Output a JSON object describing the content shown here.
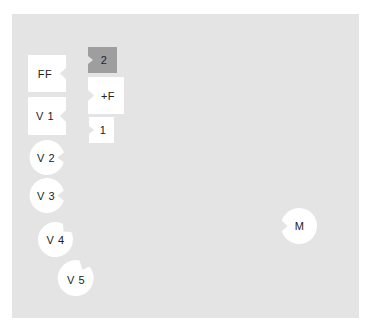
{
  "colors": {
    "background": "#ffffff",
    "panel": "#e4e4e4",
    "piece_fill": "#ffffff",
    "piece_selected_fill": "#9e9e9e",
    "text": "#222222"
  },
  "pieces": {
    "ff": {
      "label": "FF",
      "shape": "square",
      "notch": "right"
    },
    "v1": {
      "label": "V 1",
      "shape": "square",
      "notch": "right"
    },
    "v2": {
      "label": "V 2",
      "shape": "circle",
      "notch": "right"
    },
    "v3": {
      "label": "V 3",
      "shape": "circle",
      "notch": "right"
    },
    "v4": {
      "label": "V 4",
      "shape": "circle",
      "notch": "upper-right"
    },
    "v5": {
      "label": "V 5",
      "shape": "circle",
      "notch": "top-right"
    },
    "two": {
      "label": "2",
      "shape": "square",
      "notch": "left",
      "selected": true
    },
    "plus_f": {
      "label": "+F",
      "shape": "square",
      "notch": "left"
    },
    "one": {
      "label": "1",
      "shape": "square",
      "notch": "left"
    },
    "m": {
      "label": "M",
      "shape": "circle",
      "notch": "left"
    }
  }
}
